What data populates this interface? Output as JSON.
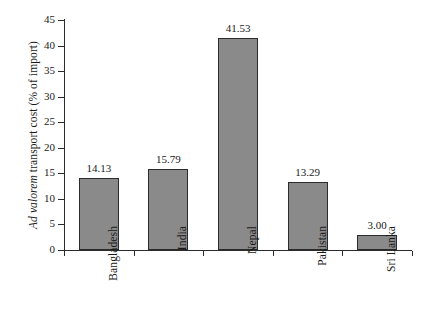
{
  "chart_data": {
    "type": "bar",
    "title": "",
    "subtitle": "",
    "xlabel": "",
    "ylabel_prefix_italic": "Ad valorem",
    "ylabel_rest": " transport cost (% of import)",
    "ylabel": "Ad valorem transport cost (% of import)",
    "categories": [
      "Bangladesh",
      "India",
      "Nepal",
      "Pakistan",
      "Sri Lanka"
    ],
    "values": [
      14.13,
      15.79,
      41.53,
      13.29,
      3.0
    ],
    "value_labels": [
      "14.13",
      "15.79",
      "41.53",
      "13.29",
      "3.00"
    ],
    "ylim": [
      0,
      45
    ],
    "ytick_values": [
      0,
      5,
      10,
      15,
      20,
      25,
      30,
      35,
      40,
      45
    ],
    "ytick_labels": [
      "0",
      "5",
      "10",
      "15",
      "20",
      "25",
      "30",
      "35",
      "40",
      "45"
    ],
    "grid": false,
    "legend": false,
    "legend_position": "none",
    "bar_fill_color": "#8a8a8a",
    "bar_edge_color": "#2b2b2b",
    "axis_color": "#2b2b2b",
    "background_color": "#ffffff"
  }
}
